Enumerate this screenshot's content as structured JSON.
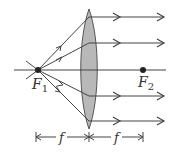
{
  "diagram": {
    "focal_point_1": {
      "label": "F",
      "subscript": "1"
    },
    "focal_point_2": {
      "label": "F",
      "subscript": "2"
    },
    "dimension_left": {
      "label": "f"
    },
    "dimension_right": {
      "label": "f"
    },
    "colors": {
      "line": "#444444",
      "lens_fill": "#b8b8b8",
      "lens_stroke": "#555555",
      "point": "#222222"
    },
    "rays_exit_y": [
      17,
      43,
      96,
      121
    ]
  }
}
